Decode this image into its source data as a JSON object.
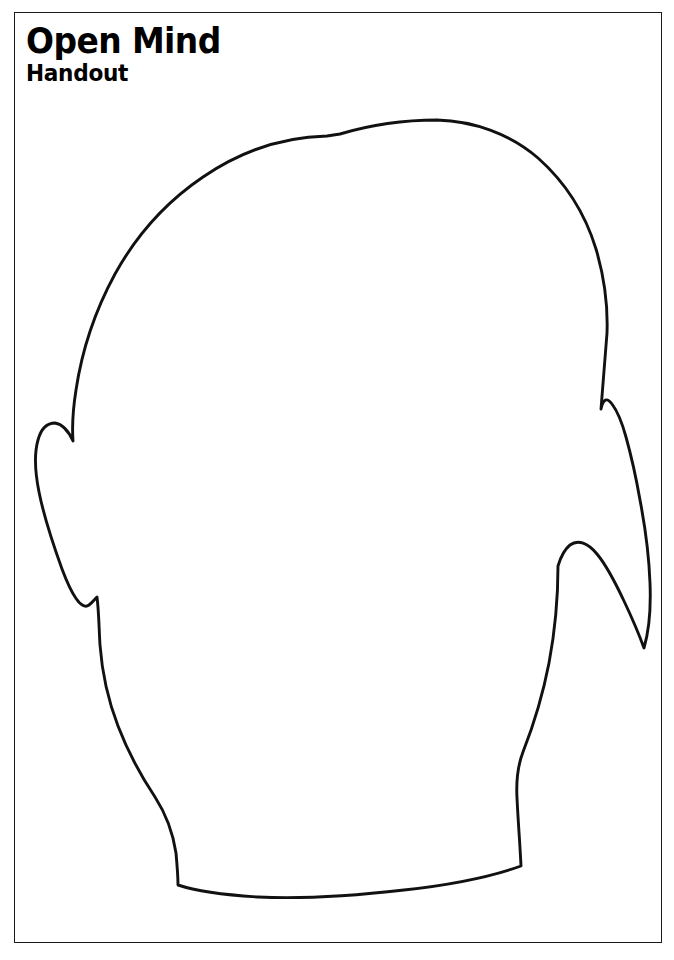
{
  "document": {
    "title": "Open Mind",
    "subtitle": "Handout",
    "page_width": 674,
    "page_height": 960,
    "background_color": "#ffffff",
    "ink_color": "#000000"
  },
  "border": {
    "name": "page-border-rule",
    "color": "#1b1b1b",
    "thickness_px": 1.6,
    "left": 14,
    "top": 12,
    "width": 648,
    "height": 931
  },
  "figure": {
    "name": "open-mind-head-outline",
    "stroke_color": "#111111",
    "fill_color": "#ffffff",
    "stroke_width_px": 2.9,
    "crown_top_y": 135,
    "crown_center_x": 327,
    "left_ear_notch": [
      73,
      441
    ],
    "right_ear_notch": [
      607,
      414
    ],
    "neck_bottom_y": 897,
    "outline_path": "M 327 136 C 281 137 238 153 203 177 C 166 202 136 236 115 274 C 96 309 82 350 76 390 C 73 409 72 427 73 441 C 68 430 62 424 55 423 C 47 423 41 429 38 440 C 34 454 35 472 39 492 C 44 517 53 544 62 569 C 71 593 81 611 89 605 C 93 602 95 599 97 597 C 99 613 99 630 100 645 C 102 672 108 700 118 726 C 128 752 141 776 155 797 C 166 814 173 833 176 853 C 177 864 178 875 178 885 C 196 891 224 895 258 897 C 300 899 352 896 404 890 C 450 885 493 876 521 866 C 520 844 518 820 517 798 C 516 780 518 765 523 752 C 534 724 543 694 549 663 C 555 631 558 597 558 566 C 561 556 565 549 570 545 C 578 539 588 543 597 554 C 607 566 616 584 624 601 C 633 620 640 637 644 648 C 649 631 651 608 650 583 C 649 556 645 526 640 500 C 636 477 631 455 626 437 C 623 426 618 412 612 404 C 607 397 603 399 601 409 C 603 384 605 358 607 333 C 608 305 604 276 596 249 C 585 213 565 182 538 158 C 510 134 474 121 437 120 C 404 120 370 125 340 134 Z"
  }
}
